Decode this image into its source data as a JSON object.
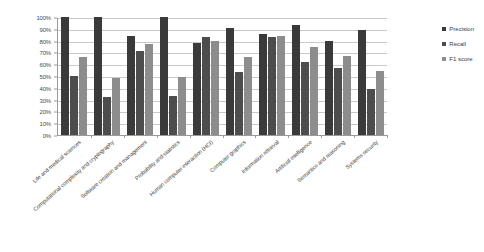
{
  "chart_data": {
    "type": "bar",
    "title": "",
    "xlabel": "",
    "ylabel": "",
    "ylim": [
      0,
      100
    ],
    "ytick_labels": [
      "100%",
      "90%",
      "80%",
      "70%",
      "60%",
      "50%",
      "40%",
      "30%",
      "20%",
      "10%",
      "0%"
    ],
    "ytick_values": [
      100,
      90,
      80,
      70,
      60,
      50,
      40,
      30,
      20,
      10,
      0
    ],
    "grid": true,
    "legend_position": "right",
    "categories": [
      "Life and medical sciences",
      "Computational complexity and cryptography",
      "Software creation and management",
      "Probability and statistics",
      "Human computer interaction (HCI)",
      "Computer graphics",
      "Information retrieval",
      "Artificial intelligence",
      "Semantics and reasoning",
      "Systems security"
    ],
    "series": [
      {
        "name": "Precision",
        "color": "#3a3a3a",
        "values": [
          100,
          100,
          84,
          100,
          78,
          91,
          86,
          93,
          80,
          89
        ]
      },
      {
        "name": "Recall",
        "color": "#4d4d4d",
        "values": [
          50,
          32,
          71,
          33,
          83,
          53,
          83,
          62,
          57,
          39
        ]
      },
      {
        "name": "F1 score",
        "color": "#8d8d8d",
        "values": [
          66,
          48,
          77,
          49,
          80,
          66,
          84,
          75,
          67,
          54
        ]
      }
    ]
  }
}
